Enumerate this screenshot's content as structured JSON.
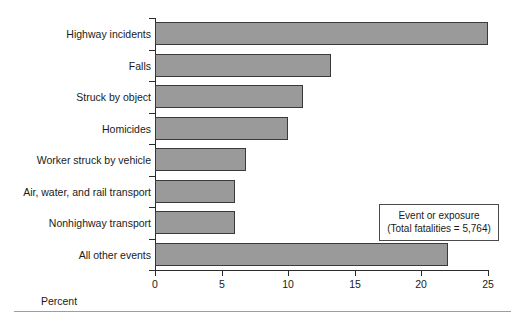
{
  "chart_data": {
    "type": "bar",
    "orientation": "horizontal",
    "title": "",
    "xlabel": "Percent",
    "ylabel": "",
    "xlim": [
      0,
      25
    ],
    "xticks": [
      0,
      5,
      10,
      15,
      20,
      25
    ],
    "xtick_labels": [
      "0",
      "5",
      "10",
      "15",
      "20",
      "25"
    ],
    "grid": false,
    "categories": [
      "Highway incidents",
      "Falls",
      "Struck by object",
      "Homicides",
      "Worker struck by vehicle",
      "Air, water, and rail transport",
      "Nonhighway transport",
      "All other events"
    ],
    "values": [
      25.0,
      13.2,
      11.1,
      10.0,
      6.8,
      6.0,
      6.0,
      22.0
    ],
    "series": [
      {
        "name": "Event or exposure",
        "values": [
          25.0,
          13.2,
          11.1,
          10.0,
          6.8,
          6.0,
          6.0,
          22.0
        ]
      }
    ],
    "bar_color": "#9a9a9a",
    "bar_edge_color": "#3a3a3a",
    "annotations": [
      {
        "name": "legend-box",
        "lines": [
          "Event or exposure",
          "(Total fatalities  =  5,764)"
        ]
      }
    ]
  },
  "legend": {
    "line1": "Event or exposure",
    "line2": "(Total fatalities  =  5,764)"
  },
  "axis": {
    "xlabel": "Percent"
  }
}
